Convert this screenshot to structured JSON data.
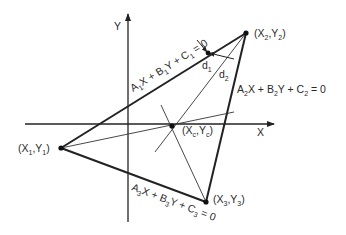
{
  "colors": {
    "background": "#ffffff",
    "stroke": "#222222",
    "text": "#2a2a2a"
  },
  "axes": {
    "x_label": "X",
    "y_label": "Y"
  },
  "points": {
    "p1": {
      "label_open": "(X",
      "sub1": "1",
      "comma": ",Y",
      "sub2": "1",
      "label_close": ")"
    },
    "p2": {
      "label_open": "(X",
      "sub1": "2",
      "comma": ",Y",
      "sub2": "2",
      "label_close": ")"
    },
    "p3": {
      "label_open": "(X",
      "sub1": "3",
      "comma": ",Y",
      "sub2": "3",
      "label_close": ")"
    },
    "centroid": {
      "label_open": "(X",
      "sub1": "c",
      "comma": ",Y",
      "sub2": "c",
      "label_close": ")"
    }
  },
  "lines": {
    "line1": {
      "a": "A",
      "a_sub": "1",
      "x": "X + B",
      "b_sub": "1",
      "y": "Y + C",
      "c_sub": "1",
      "eq": " = 0"
    },
    "line2": {
      "a": "A",
      "a_sub": "2",
      "x": "X + B",
      "b_sub": "2",
      "y": "Y + C",
      "c_sub": "2",
      "eq": " = 0"
    },
    "line3": {
      "a": "A",
      "a_sub": "3",
      "x": "X + B",
      "b_sub": "3",
      "y": "Y + C",
      "c_sub": "3",
      "eq": " = 0"
    }
  },
  "distances": {
    "d1": {
      "main": "d",
      "sub": "1"
    },
    "d2": {
      "main": "d",
      "sub": "2"
    }
  }
}
